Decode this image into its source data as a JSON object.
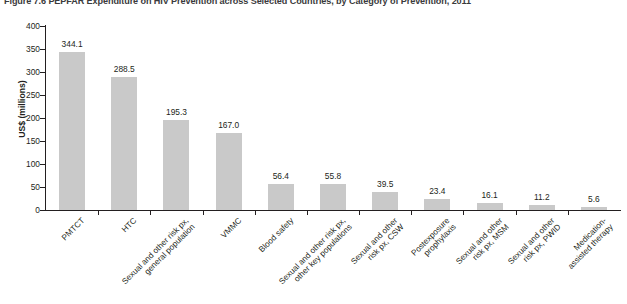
{
  "figure": {
    "title": "Figure 7.6 PEPFAR Expenditure on HIV Prevention across Selected Countries, by Category of Prevention, 2011"
  },
  "chart_data": {
    "type": "bar",
    "title": "Figure 7.6 PEPFAR Expenditure on HIV Prevention across Selected Countries, by Category of Prevention, 2011",
    "xlabel": "",
    "ylabel": "US$ (millions)",
    "ylim": [
      0,
      400
    ],
    "ytick_values": [
      0,
      50,
      100,
      150,
      200,
      250,
      300,
      350,
      400
    ],
    "ytick_labels": [
      "0",
      "50",
      "100",
      "150",
      "200",
      "250",
      "300",
      "350",
      "400"
    ],
    "grid": false,
    "legend": false,
    "bar_color": "#c9c9c9",
    "categories": [
      "PMTCT",
      "HTC",
      "Sexual and other risk px,\ngeneral population",
      "VMMC",
      "Blood safety",
      "Sexual and other risk px,\nother key populations",
      "Sexual and other\nrisk px, CSW",
      "Postexposure\nprophylaxis",
      "Sexual and other\nrisk px, MSM",
      "Sexual and other\nrisk px, PWID",
      "Medication-\nassisted therapy"
    ],
    "values": [
      344.1,
      288.5,
      195.3,
      167.0,
      56.4,
      55.8,
      39.5,
      23.4,
      16.1,
      11.2,
      5.6
    ],
    "value_labels": [
      "344.1",
      "288.5",
      "195.3",
      "167.0",
      "56.4",
      "55.8",
      "39.5",
      "23.4",
      "16.1",
      "11.2",
      "5.6"
    ]
  }
}
